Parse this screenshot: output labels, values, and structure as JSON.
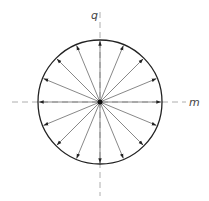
{
  "diagram": {
    "center": [
      100,
      102
    ],
    "radius": 62,
    "arrow_count": 16,
    "colors": {
      "circle": "#222222",
      "arrow": "#555555",
      "axis": "#999999",
      "center_dot": "#111111"
    },
    "axes": {
      "vertical": {
        "label": "q",
        "from": 12,
        "to": 196
      },
      "horizontal": {
        "label": "m",
        "from": 12,
        "to": 186
      }
    }
  }
}
